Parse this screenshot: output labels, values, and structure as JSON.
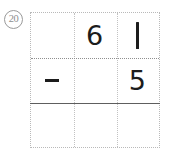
{
  "problem": {
    "marker_label": "20",
    "marker_icon": "circled-number-badge",
    "operation": "subtraction",
    "minuend": "61",
    "subtrahend": "5",
    "answer": ""
  },
  "grid": {
    "columns": 3,
    "rows": 3,
    "row_divider_style": "dotted",
    "answer_rule_style": "solid",
    "border_color": "#b9b9b9",
    "rule_color": "#5e5e5e",
    "digit_color": "#1c1c1c",
    "cells": [
      [
        {
          "value": "",
          "kind": "blank"
        },
        {
          "value": "6",
          "kind": "digit"
        },
        {
          "value": "1",
          "kind": "digit-stroke"
        }
      ],
      [
        {
          "value": "−",
          "kind": "operator"
        },
        {
          "value": "",
          "kind": "blank"
        },
        {
          "value": "5",
          "kind": "digit"
        }
      ],
      [
        {
          "value": "",
          "kind": "blank"
        },
        {
          "value": "",
          "kind": "blank"
        },
        {
          "value": "",
          "kind": "blank"
        }
      ]
    ]
  }
}
